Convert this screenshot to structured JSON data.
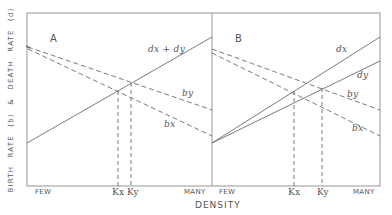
{
  "figure": {
    "y_axis_label": "BIRTH RATE (b) & DEATH RATE (d)",
    "x_axis_label": "DENSITY",
    "colors": {
      "line": "#6b6b6b",
      "frame": "#8a8a8a",
      "text": "#555555"
    }
  },
  "panels": [
    {
      "id": "A",
      "label": "A",
      "x_tick_left": "FEW",
      "x_tick_right": "MANY",
      "equilibria": [
        {
          "label": "Kx"
        },
        {
          "label": "Ky"
        }
      ],
      "curves": [
        {
          "name": "dx + dy",
          "label": "dx + dy",
          "style": "solid"
        },
        {
          "name": "by",
          "label": "by",
          "style": "dashed"
        },
        {
          "name": "bx",
          "label": "bx",
          "style": "dashed"
        }
      ]
    },
    {
      "id": "B",
      "label": "B",
      "x_tick_left": "FEW",
      "x_tick_right": "MANY",
      "equilibria": [
        {
          "label": "Kx"
        },
        {
          "label": "Ky"
        }
      ],
      "curves": [
        {
          "name": "dx",
          "label": "dx",
          "style": "solid"
        },
        {
          "name": "dy",
          "label": "dy",
          "style": "solid"
        },
        {
          "name": "by",
          "label": "by",
          "style": "dashed"
        },
        {
          "name": "bx",
          "label": "bx",
          "style": "dashed"
        }
      ]
    }
  ]
}
